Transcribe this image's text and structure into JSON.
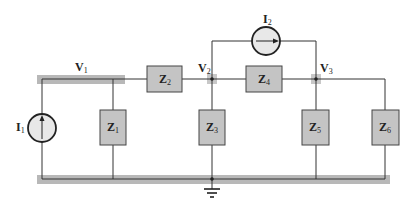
{
  "diagram": {
    "type": "circuit",
    "colors": {
      "wire": "#333333",
      "node_bar": "#b8b8b8",
      "impedance_fill": "#c4c4c4",
      "source_fill": "#e8e8e8"
    },
    "nodes": [
      {
        "id": "V1",
        "label": "V",
        "sub": "1"
      },
      {
        "id": "V2",
        "label": "V",
        "sub": "2"
      },
      {
        "id": "V3",
        "label": "V",
        "sub": "3"
      }
    ],
    "impedances": [
      {
        "id": "Z1",
        "label": "Z",
        "sub": "1"
      },
      {
        "id": "Z2",
        "label": "Z",
        "sub": "2"
      },
      {
        "id": "Z3",
        "label": "Z",
        "sub": "3"
      },
      {
        "id": "Z4",
        "label": "Z",
        "sub": "4"
      },
      {
        "id": "Z5",
        "label": "Z",
        "sub": "5"
      },
      {
        "id": "Z6",
        "label": "Z",
        "sub": "6"
      }
    ],
    "sources": [
      {
        "id": "I1",
        "label": "I",
        "sub": "1",
        "direction": "up"
      },
      {
        "id": "I2",
        "label": "I",
        "sub": "2",
        "direction": "right"
      }
    ],
    "ground": "ground-symbol"
  }
}
